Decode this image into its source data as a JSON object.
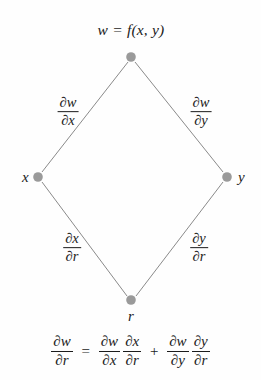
{
  "figure": {
    "type": "chain-rule-tree-diagram",
    "background_color": "#fefefe",
    "node_color": "#9a9a9a",
    "edge_color": "#8a8a8a",
    "text_color": "#1b1b1b"
  },
  "nodes": [
    {
      "id": "w",
      "label": "w = f(x, y)",
      "x": 131,
      "y": 57
    },
    {
      "id": "x",
      "label": "x",
      "x": 38,
      "y": 177
    },
    {
      "id": "y",
      "label": "y",
      "x": 227,
      "y": 177
    },
    {
      "id": "r",
      "label": "r",
      "x": 131,
      "y": 300
    }
  ],
  "edges": [
    {
      "id": "w-x",
      "from": "w",
      "to": "x",
      "label": {
        "partial": "∂",
        "numerator": "w",
        "denominator": "x"
      },
      "label_x": 68,
      "label_y": 112
    },
    {
      "id": "w-y",
      "from": "w",
      "to": "y",
      "label": {
        "partial": "∂",
        "numerator": "w",
        "denominator": "y"
      },
      "label_x": 201,
      "label_y": 112
    },
    {
      "id": "x-r",
      "from": "x",
      "to": "r",
      "label": {
        "partial": "∂",
        "numerator": "x",
        "denominator": "r"
      },
      "label_x": 72,
      "label_y": 248
    },
    {
      "id": "y-r",
      "from": "y",
      "to": "r",
      "label": {
        "partial": "∂",
        "numerator": "y",
        "denominator": "r"
      },
      "label_x": 199,
      "label_y": 248
    }
  ],
  "labels": {
    "partial": "∂",
    "w": "w",
    "x": "x",
    "y": "y",
    "r": "r",
    "node_w_full": "w = f(x, y)",
    "node_x": "x",
    "node_y": "y",
    "node_r": "r",
    "dw_dx_num": "w",
    "dw_dx_den": "x",
    "dw_dy_num": "w",
    "dw_dy_den": "y",
    "dx_dr_num": "x",
    "dx_dr_den": "r",
    "dy_dr_num": "y",
    "dy_dr_den": "r"
  },
  "equation": {
    "plain_text": "∂w/∂r = ∂w/∂x ∂x/∂r + ∂w/∂y ∂y/∂r",
    "equals": "=",
    "plus": "+",
    "terms": {
      "lhs": {
        "num_partial": "∂",
        "num_var": "w",
        "den_partial": "∂",
        "den_var": "r"
      },
      "t1a": {
        "num_partial": "∂",
        "num_var": "w",
        "den_partial": "∂",
        "den_var": "x"
      },
      "t1b": {
        "num_partial": "∂",
        "num_var": "x",
        "den_partial": "∂",
        "den_var": "r"
      },
      "t2a": {
        "num_partial": "∂",
        "num_var": "w",
        "den_partial": "∂",
        "den_var": "y"
      },
      "t2b": {
        "num_partial": "∂",
        "num_var": "y",
        "den_partial": "∂",
        "den_var": "r"
      }
    }
  }
}
